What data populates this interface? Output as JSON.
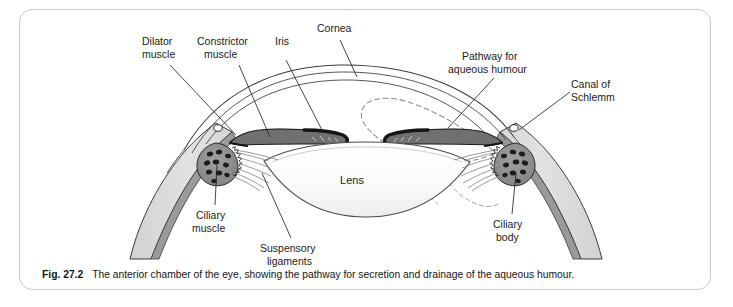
{
  "figure": {
    "number": "Fig. 27.2",
    "caption": "The anterior chamber of the eye, showing the pathway for secretion and drainage of the aqueous humour.",
    "title": "The anterior chamber of the eye"
  },
  "labels": {
    "dilator_muscle_line1": "Dilator",
    "dilator_muscle_line2": "muscle",
    "constrictor_muscle_line1": "Constrictor",
    "constrictor_muscle_line2": "muscle",
    "iris": "Iris",
    "cornea": "Cornea",
    "pathway_line1": "Pathway for",
    "pathway_line2": "aqueous humour",
    "canal_line1": "Canal of",
    "canal_line2": "Schlemm",
    "ciliary_muscle_line1": "Ciliary",
    "ciliary_muscle_line2": "muscle",
    "suspensory_line1": "Suspensory",
    "suspensory_line2": "ligaments",
    "ciliary_body_line1": "Ciliary",
    "ciliary_body_line2": "body",
    "lens": "Lens"
  },
  "colors": {
    "panel_border": "#c9c9cc",
    "background": "#ffffff",
    "outline": "#3a3a3a",
    "sclera_fill": "#dcdcdc",
    "choroid_fill": "#9a9a9a",
    "iris_fill": "#707070",
    "iris_margin": "#151515",
    "ciliary_process": "#1c1c1c",
    "ciliary_body_fill": "#8a8a8a",
    "lens_fill": "#fafafa",
    "pathway_dash": "#8c8c8c",
    "text": "#1a1a1a"
  },
  "structures": [
    "cornea",
    "sclera",
    "choroid",
    "iris",
    "dilator-muscle",
    "constrictor-muscle",
    "lens",
    "suspensory-ligaments",
    "ciliary-body",
    "ciliary-muscle",
    "canal-of-schlemm",
    "aqueous-pathway"
  ]
}
